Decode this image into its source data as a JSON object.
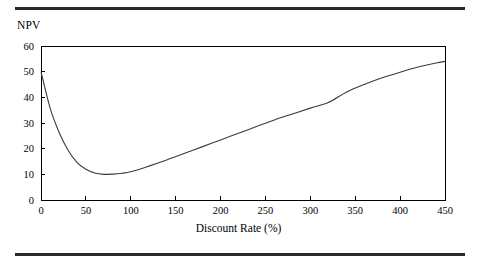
{
  "figure": {
    "background_color": "#ffffff",
    "rule_color": "#2a2a2a",
    "has_top_rule": true,
    "has_bottom_rule": true
  },
  "labels": {
    "y_axis_title": "NPV",
    "x_axis_title": "Discount Rate (%)"
  },
  "chart_data": {
    "type": "line",
    "title": "",
    "subtitle": "",
    "xlabel": "Discount Rate (%)",
    "ylabel": "NPV",
    "xlim": [
      0,
      450
    ],
    "ylim": [
      0,
      60
    ],
    "xticks": [
      0,
      50,
      100,
      150,
      200,
      250,
      300,
      350,
      400,
      450
    ],
    "xticklabels": [
      "0",
      "50",
      "100",
      "150",
      "200",
      "250",
      "300",
      "350",
      "400",
      "450"
    ],
    "yticks": [
      0,
      10,
      20,
      30,
      40,
      50,
      60
    ],
    "yticklabels": [
      "0",
      "10",
      "20",
      "30",
      "40",
      "50",
      "60"
    ],
    "grid": false,
    "legend": null,
    "legend_position": "none",
    "line_color": "#3a3a3a",
    "line_width": 1.1,
    "annotations": [],
    "series": [
      {
        "name": "NPV",
        "x": [
          0,
          10,
          20,
          30,
          40,
          50,
          60,
          70,
          80,
          90,
          100,
          120,
          140,
          160,
          180,
          200,
          220,
          240,
          260,
          280,
          300,
          320,
          340,
          360,
          380,
          400,
          420,
          440,
          450
        ],
        "values": [
          50.0,
          36.0,
          26.5,
          19.5,
          14.7,
          12.0,
          10.5,
          10.0,
          10.1,
          10.4,
          11.0,
          13.2,
          15.6,
          18.2,
          20.8,
          23.4,
          26.0,
          28.6,
          31.2,
          33.5,
          35.8,
          38.0,
          42.0,
          45.0,
          47.6,
          49.8,
          51.8,
          53.4,
          54.0
        ]
      }
    ],
    "minimum": {
      "x": 70,
      "y": 10.0
    },
    "start_point": {
      "x": 0,
      "y": 50.0
    },
    "end_point": {
      "x": 450,
      "y": 54.0
    }
  },
  "plot_box": {
    "left_px": 41,
    "right_px": 445,
    "top_px": 46,
    "bottom_px": 200
  }
}
